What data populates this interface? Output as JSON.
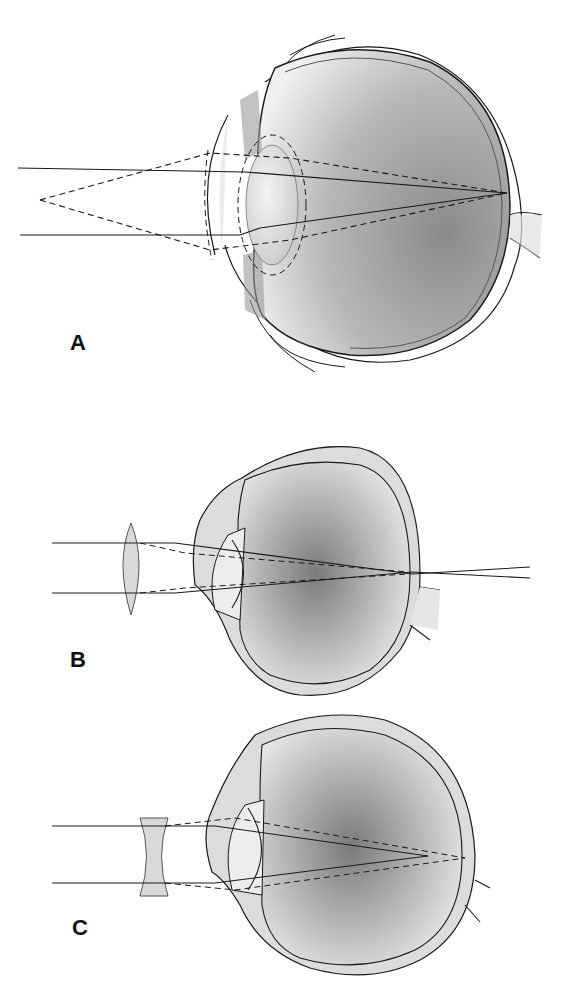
{
  "figure": {
    "panels": [
      {
        "id": "A",
        "label": "A"
      },
      {
        "id": "B",
        "label": "B"
      },
      {
        "id": "C",
        "label": "C"
      }
    ],
    "colors": {
      "line": "#1a1a1a",
      "eye_fill_light": "#f2f2f2",
      "eye_fill_dark": "#8a8a8a",
      "wall_fill": "#dcdcdc",
      "lens_fill": "#d9d9d9",
      "background": "#ffffff"
    }
  }
}
